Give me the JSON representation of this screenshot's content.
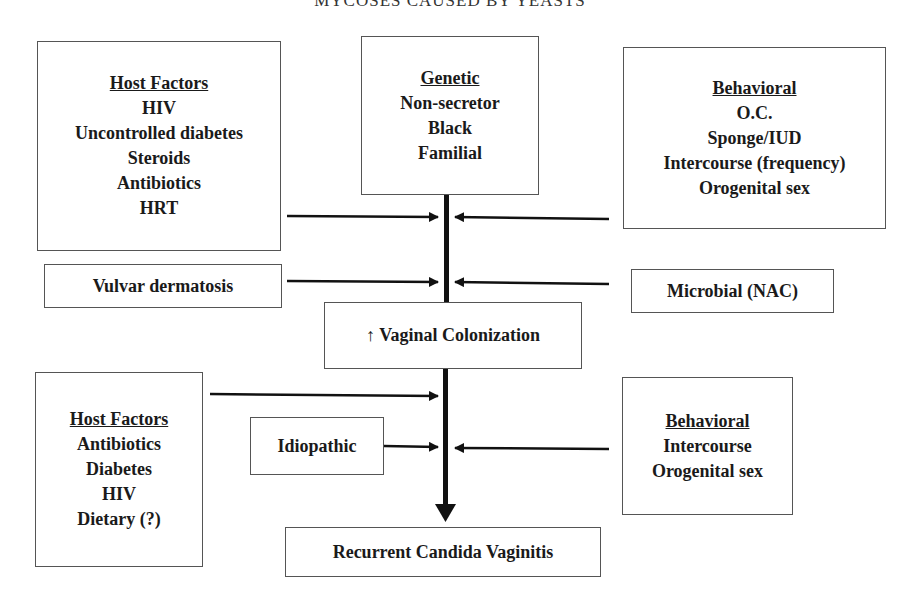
{
  "header": {
    "text": "MYCOSES CAUSED BY YEASTS"
  },
  "top_row": {
    "host_factors": {
      "title": "Host Factors",
      "items": [
        "HIV",
        "Uncontrolled diabetes",
        "Steroids",
        "Antibiotics",
        "HRT"
      ]
    },
    "genetic": {
      "title": "Genetic",
      "items": [
        "Non-secretor",
        "Black",
        "Familial"
      ]
    },
    "behavioral": {
      "title": "Behavioral",
      "items": [
        "O.C.",
        "Sponge/IUD",
        "Intercourse (frequency)",
        "Orogenital sex"
      ]
    }
  },
  "middle_row": {
    "vulvar": {
      "label": "Vulvar dermatosis"
    },
    "microbial": {
      "label": "Microbial (NAC)"
    },
    "colonization": {
      "label": "↑ Vaginal Colonization"
    }
  },
  "bottom_row": {
    "host_factors": {
      "title": "Host Factors",
      "items": [
        "Antibiotics",
        "Diabetes",
        "HIV",
        "Dietary (?)"
      ]
    },
    "idiopathic": {
      "label": "Idiopathic"
    },
    "behavioral": {
      "title": "Behavioral",
      "items": [
        "Intercourse",
        "Orogenital sex"
      ]
    }
  },
  "outcome": {
    "label": "Recurrent Candida Vaginitis"
  }
}
